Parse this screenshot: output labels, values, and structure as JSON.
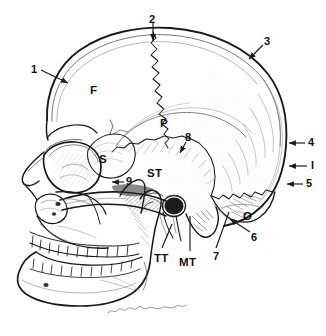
{
  "figure": {
    "background_color": "#ffffff",
    "ink_color": "#1a1a1a",
    "width": 326,
    "height": 336
  },
  "bone_labels": [
    {
      "id": "frontal",
      "text": "F",
      "x": 90,
      "y": 85,
      "name": "bone-label-frontal"
    },
    {
      "id": "parietal",
      "text": "P",
      "x": 160,
      "y": 118,
      "name": "bone-label-parietal"
    },
    {
      "id": "sphenoid",
      "text": "S",
      "x": 99,
      "y": 154,
      "name": "bone-label-sphenoid"
    },
    {
      "id": "squamous-temporal",
      "text": "ST",
      "x": 147,
      "y": 168,
      "name": "bone-label-squamous-temporal"
    },
    {
      "id": "occipital",
      "text": "O",
      "x": 243,
      "y": 211,
      "name": "bone-label-occipital"
    },
    {
      "id": "tympanic-temporal",
      "text": "TT",
      "x": 154,
      "y": 253,
      "name": "bone-label-tympanic-temporal"
    },
    {
      "id": "mastoid-temporal",
      "text": "MT",
      "x": 179,
      "y": 257,
      "name": "bone-label-mastoid-temporal"
    }
  ],
  "number_labels": [
    {
      "id": "n1",
      "text": "1",
      "x": 31,
      "y": 64,
      "name": "callout-label-1"
    },
    {
      "id": "n2",
      "text": "2",
      "x": 149,
      "y": 14,
      "name": "callout-label-2"
    },
    {
      "id": "n3",
      "text": "3",
      "x": 264,
      "y": 36,
      "name": "callout-label-3"
    },
    {
      "id": "n4",
      "text": "4",
      "x": 308,
      "y": 140,
      "name": "callout-label-4"
    },
    {
      "id": "nI",
      "text": "I",
      "x": 310,
      "y": 163,
      "name": "callout-label-I"
    },
    {
      "id": "n5",
      "text": "5",
      "x": 306,
      "y": 181,
      "name": "callout-label-5"
    },
    {
      "id": "n6",
      "text": "6",
      "x": 251,
      "y": 234,
      "name": "callout-label-6"
    },
    {
      "id": "n7",
      "text": "7",
      "x": 213,
      "y": 253,
      "name": "callout-label-7"
    },
    {
      "id": "n8",
      "text": "8",
      "x": 185,
      "y": 137,
      "name": "callout-label-8"
    },
    {
      "id": "n9",
      "text": "9",
      "x": 126,
      "y": 180,
      "name": "callout-label-9"
    }
  ],
  "leaders": [
    {
      "id": "l1",
      "name": "leader-line-1",
      "from": [
        41,
        70
      ],
      "to": [
        70,
        84
      ],
      "arrow": true
    },
    {
      "id": "l2",
      "name": "leader-line-2",
      "from": [
        153,
        22
      ],
      "to": [
        153,
        43
      ],
      "arrow": true
    },
    {
      "id": "l3",
      "name": "leader-line-3",
      "from": [
        263,
        44
      ],
      "to": [
        248,
        60
      ],
      "arrow": true
    },
    {
      "id": "l4",
      "name": "leader-line-4",
      "from": [
        305,
        143
      ],
      "to": [
        288,
        143
      ],
      "arrow": true
    },
    {
      "id": "lI",
      "name": "leader-line-I",
      "from": [
        307,
        166
      ],
      "to": [
        288,
        166
      ],
      "arrow": true
    },
    {
      "id": "l5",
      "name": "leader-line-5",
      "from": [
        303,
        184
      ],
      "to": [
        286,
        184
      ],
      "arrow": true
    },
    {
      "id": "l6",
      "name": "leader-line-6",
      "from": [
        249,
        233
      ],
      "to": [
        228,
        219
      ],
      "arrow": true
    },
    {
      "id": "l7",
      "name": "leader-line-7",
      "from": [
        216,
        249
      ],
      "to": [
        228,
        211
      ],
      "arrow": false
    },
    {
      "id": "l8",
      "name": "leader-line-8",
      "from": [
        186,
        143
      ],
      "to": [
        179,
        154
      ],
      "arrow": true
    },
    {
      "id": "l9",
      "name": "leader-line-9",
      "from": [
        124,
        182
      ],
      "to": [
        113,
        182
      ],
      "arrow": true
    },
    {
      "id": "lTT",
      "name": "leader-line-tt",
      "from": [
        162,
        249
      ],
      "to": [
        172,
        226
      ],
      "arrow": false
    },
    {
      "id": "lMT",
      "name": "leader-line-mt",
      "from": [
        190,
        252
      ],
      "to": [
        190,
        218
      ],
      "arrow": false
    }
  ],
  "signature": {
    "present": true,
    "name": "artist-signature"
  }
}
